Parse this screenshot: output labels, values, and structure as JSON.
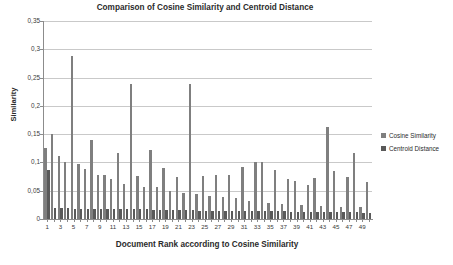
{
  "chart_data": {
    "type": "bar",
    "title": "Comparison of Cosine Similarity and Centroid Distance",
    "xlabel": "Document Rank according to Cosine Similarity",
    "ylabel": "Similarity",
    "ylim": [
      0,
      0.35
    ],
    "ytick_labels": [
      "0",
      "0,05",
      "0,1",
      "0,15",
      "0,2",
      "0,25",
      "0,3",
      "0,35"
    ],
    "ytick_values": [
      0,
      0.05,
      0.1,
      0.15,
      0.2,
      0.25,
      0.3,
      0.35
    ],
    "xtick_labels": [
      "1",
      "3",
      "5",
      "7",
      "9",
      "11",
      "13",
      "15",
      "17",
      "19",
      "21",
      "23",
      "25",
      "27",
      "29",
      "31",
      "33",
      "35",
      "37",
      "39",
      "41",
      "43",
      "45",
      "47",
      "49"
    ],
    "grid": true,
    "legend_position": "right",
    "categories": [
      1,
      2,
      3,
      4,
      5,
      6,
      7,
      8,
      9,
      10,
      11,
      12,
      13,
      14,
      15,
      16,
      17,
      18,
      19,
      20,
      21,
      22,
      23,
      24,
      25,
      26,
      27,
      28,
      29,
      30,
      31,
      32,
      33,
      34,
      35,
      36,
      37,
      38,
      39,
      40,
      41,
      42,
      43,
      44,
      45,
      46,
      47,
      48,
      49,
      50
    ],
    "series": [
      {
        "name": "Cosine Similarity",
        "color": "#7f7f7f",
        "values": [
          0.125,
          0.151,
          0.112,
          0.1,
          0.288,
          0.098,
          0.089,
          0.14,
          0.078,
          0.077,
          0.071,
          0.117,
          0.062,
          0.238,
          0.076,
          0.056,
          0.122,
          0.056,
          0.09,
          0.049,
          0.075,
          0.046,
          0.238,
          0.044,
          0.076,
          0.04,
          0.078,
          0.039,
          0.077,
          0.038,
          0.092,
          0.031,
          0.1,
          0.101,
          0.029,
          0.086,
          0.026,
          0.07,
          0.067,
          0.024,
          0.061,
          0.073,
          0.023,
          0.162,
          0.084,
          0.022,
          0.074,
          0.116,
          0.021,
          0.065
        ]
      },
      {
        "name": "Centroid Distance",
        "color": "#595959",
        "values": [
          0.086,
          0.019,
          0.019,
          0.019,
          0.018,
          0.018,
          0.018,
          0.018,
          0.018,
          0.017,
          0.017,
          0.017,
          0.017,
          0.017,
          0.017,
          0.017,
          0.016,
          0.016,
          0.016,
          0.016,
          0.016,
          0.016,
          0.016,
          0.015,
          0.015,
          0.015,
          0.015,
          0.015,
          0.015,
          0.015,
          0.014,
          0.014,
          0.014,
          0.014,
          0.014,
          0.014,
          0.014,
          0.013,
          0.013,
          0.013,
          0.013,
          0.013,
          0.013,
          0.012,
          0.012,
          0.012,
          0.012,
          0.012,
          0.011,
          0.011
        ]
      }
    ],
    "tail_cosine": [
      0.086,
      0.06,
      0.073,
      0.056,
      0.065,
      0.086,
      0.059,
      0.106,
      0.055,
      0.071,
      0.067,
      0.057,
      0.062,
      0.06,
      0.062,
      0.085,
      0.105,
      0.058,
      0.105,
      0.075,
      0.063,
      0.08,
      0.073,
      0.074,
      0.078,
      0.103,
      0.061
    ]
  },
  "legend": {
    "items": [
      {
        "label": "Cosine Similarity",
        "swatch": "cosine"
      },
      {
        "label": "Centroid Distance",
        "swatch": "centroid"
      }
    ]
  }
}
